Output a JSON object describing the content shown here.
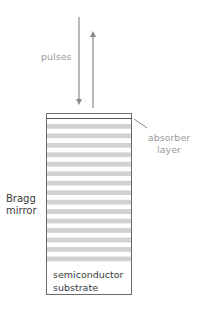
{
  "labels": {
    "pulses": "pulses",
    "absorber_line1": "absorber",
    "absorber_line2": "layer",
    "bragg_line1": "Bragg",
    "bragg_line2": "mirror",
    "substrate_line1": "semiconductor",
    "substrate_line2": "substrate"
  },
  "structure": {
    "mirror_stripe_count": 15
  },
  "colors": {
    "arrow": "#8a8a8a",
    "outline": "#6a6a6a",
    "stripe": "#d2d2d2",
    "label_grey": "#9a9a9a",
    "label_dark": "#3a3a3a"
  }
}
